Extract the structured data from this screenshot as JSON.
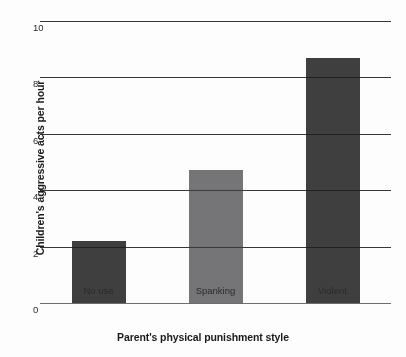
{
  "chart_data": {
    "type": "bar",
    "title": "",
    "xlabel": "Parent's physical punishment style",
    "ylabel": "Children's aggressive acts per hour",
    "categories": [
      "No use",
      "Spanking",
      "Violent"
    ],
    "values": [
      2.2,
      4.7,
      8.7
    ],
    "bar_colors": [
      "#403f40",
      "#757578",
      "#403f40"
    ],
    "ylim": [
      0,
      10
    ],
    "yticks": [
      0,
      2,
      4,
      6,
      8,
      10
    ],
    "ytick_labels": [
      "0",
      "2",
      "4",
      "6",
      "8",
      "10"
    ],
    "grid": true,
    "grid_color": "#6e6e6e",
    "legend": false,
    "background": "#fdfdfd"
  }
}
